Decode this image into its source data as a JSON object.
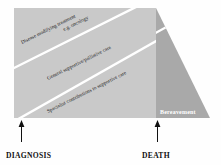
{
  "figure": {
    "type": "diagram",
    "background_color": "#fefefe"
  },
  "shape": {
    "main_fill": "#c9c9c9",
    "bereavement_fill": "#a9a9a9",
    "divider_color": "#ffffff"
  },
  "bands": [
    {
      "id": "disease-modifying",
      "line1": "Disease modifying treatment",
      "line2": "e.g. oncology"
    },
    {
      "id": "general-supportive",
      "line1": "General supportive/palliative care"
    },
    {
      "id": "specialist-contributions",
      "line1": "Specialist contributions to supportive care"
    }
  ],
  "bereavement": {
    "label": "Bereavement"
  },
  "axis_markers": [
    {
      "id": "diagnosis",
      "label": "DIAGNOSIS",
      "arrow": "up-arrow-icon"
    },
    {
      "id": "death",
      "label": "DEATH",
      "arrow": "up-arrow-icon"
    }
  ]
}
